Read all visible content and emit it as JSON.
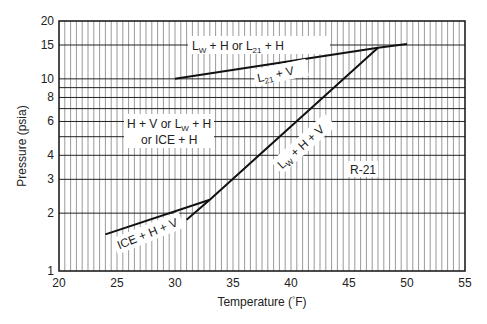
{
  "chart_data": {
    "type": "line",
    "title": "",
    "xlabel": "Temperature (°F)",
    "ylabel": "Pressure (psia)",
    "xlim": [
      20,
      55
    ],
    "ylim": [
      1,
      20
    ],
    "yscale": "log",
    "grid": true,
    "x_ticks": [
      "20",
      "25",
      "30",
      "35",
      "40",
      "45",
      "50",
      "55"
    ],
    "y_ticks": [
      "1",
      "2",
      "3",
      "4",
      "6",
      "8",
      "10",
      "15",
      "20"
    ],
    "series": [
      {
        "name": "L21 + V boundary",
        "x": [
          30,
          47.5,
          50
        ],
        "y": [
          10.0,
          14.5,
          15.2
        ]
      },
      {
        "name": "Lw + H + V",
        "x": [
          31,
          33,
          47.5
        ],
        "y": [
          1.85,
          2.35,
          14.5
        ]
      },
      {
        "name": "ICE + H + V",
        "x": [
          24,
          33
        ],
        "y": [
          1.55,
          2.35
        ]
      }
    ],
    "annotations": [
      {
        "text": "Lw + H or L21 + H",
        "x": 40,
        "y": 15
      },
      {
        "text": "L21 + V",
        "x": 41,
        "y": 11
      },
      {
        "text": "H + V or Lw + H or ICE + H",
        "x": 28,
        "y": 5.5
      },
      {
        "text": "Lw + H + V",
        "x": 40,
        "y": 4.5
      },
      {
        "text": "ICE + H + V",
        "x": 28,
        "y": 1.7
      },
      {
        "text": "R-21",
        "x": 48,
        "y": 3.3
      }
    ],
    "legend": "none"
  },
  "labels": {
    "xlabel_prefix": "Temperature (",
    "xlabel_deg": "°",
    "xlabel_suffix": "F)",
    "ylabel": "Pressure (psia)",
    "region_top_a": "L",
    "region_top_a_sub": "W",
    "region_top_b": " + H or L",
    "region_top_b_sub": "21",
    "region_top_c": " + H",
    "region_l21v_a": "L",
    "region_l21v_sub": "21",
    "region_l21v_b": " + V",
    "region_left_line1_a": "H + V or L",
    "region_left_line1_sub": "W",
    "region_left_line1_b": " + H",
    "region_left_line2": "or ICE + H",
    "region_lwhv_a": "L",
    "region_lwhv_sub": "W",
    "region_lwhv_b": " + H + V",
    "region_ice": "ICE + H + V",
    "region_r21": "R-21"
  }
}
